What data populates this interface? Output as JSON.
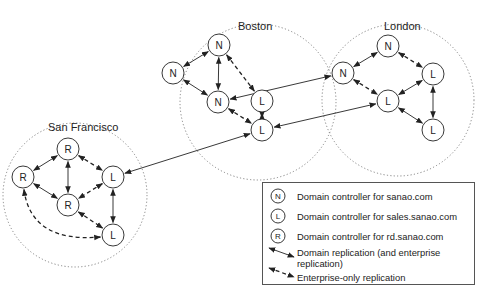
{
  "sites": [
    {
      "name": "Boston",
      "boundary": {
        "cx": 258,
        "cy": 102,
        "r": 78
      },
      "label_pos": {
        "x": 238,
        "y": 30
      },
      "nodes": [
        {
          "id": "b1",
          "letter": "N",
          "x": 219,
          "y": 45
        },
        {
          "id": "b2",
          "letter": "N",
          "x": 173,
          "y": 73
        },
        {
          "id": "b3",
          "letter": "L",
          "x": 262,
          "y": 101
        },
        {
          "id": "b4",
          "letter": "N",
          "x": 218,
          "y": 102
        },
        {
          "id": "b5",
          "letter": "L",
          "x": 262,
          "y": 130
        }
      ]
    },
    {
      "name": "London",
      "boundary": {
        "cx": 398,
        "cy": 100,
        "r": 76
      },
      "label_pos": {
        "x": 384,
        "y": 30
      },
      "nodes": [
        {
          "id": "l1",
          "letter": "N",
          "x": 388,
          "y": 46
        },
        {
          "id": "l2",
          "letter": "N",
          "x": 343,
          "y": 73
        },
        {
          "id": "l3",
          "letter": "L",
          "x": 433,
          "y": 74
        },
        {
          "id": "l4",
          "letter": "L",
          "x": 388,
          "y": 101
        },
        {
          "id": "l5",
          "letter": "L",
          "x": 433,
          "y": 130
        }
      ]
    },
    {
      "name": "San Francisco",
      "boundary": {
        "cx": 75,
        "cy": 195,
        "r": 72
      },
      "label_pos": {
        "x": 48,
        "y": 131
      },
      "nodes": [
        {
          "id": "s1",
          "letter": "R",
          "x": 68,
          "y": 149
        },
        {
          "id": "s2",
          "letter": "R",
          "x": 23,
          "y": 177
        },
        {
          "id": "s3",
          "letter": "L",
          "x": 113,
          "y": 177
        },
        {
          "id": "s4",
          "letter": "R",
          "x": 68,
          "y": 205
        },
        {
          "id": "s5",
          "letter": "L",
          "x": 113,
          "y": 235
        }
      ]
    }
  ],
  "edges": [
    {
      "from": "b1",
      "to": "b2",
      "type": "domain"
    },
    {
      "from": "b1",
      "to": "b4",
      "type": "domain"
    },
    {
      "from": "b2",
      "to": "b4",
      "type": "domain"
    },
    {
      "from": "b1",
      "to": "b3",
      "type": "enterprise"
    },
    {
      "from": "b4",
      "to": "b5",
      "type": "enterprise"
    },
    {
      "from": "b3",
      "to": "b5",
      "type": "domain"
    },
    {
      "from": "l1",
      "to": "l2",
      "type": "domain"
    },
    {
      "from": "l1",
      "to": "l3",
      "type": "enterprise"
    },
    {
      "from": "l2",
      "to": "l4",
      "type": "enterprise"
    },
    {
      "from": "l3",
      "to": "l4",
      "type": "domain"
    },
    {
      "from": "l4",
      "to": "l5",
      "type": "domain"
    },
    {
      "from": "l3",
      "to": "l5",
      "type": "domain"
    },
    {
      "from": "s1",
      "to": "s2",
      "type": "domain"
    },
    {
      "from": "s1",
      "to": "s4",
      "type": "domain"
    },
    {
      "from": "s2",
      "to": "s4",
      "type": "domain"
    },
    {
      "from": "s1",
      "to": "s3",
      "type": "enterprise"
    },
    {
      "from": "s3",
      "to": "s4",
      "type": "enterprise"
    },
    {
      "from": "s3",
      "to": "s5",
      "type": "domain"
    },
    {
      "from": "s4",
      "to": "s5",
      "type": "enterprise"
    },
    {
      "from": "s2",
      "to": "s5",
      "type": "enterprise",
      "curved": true
    },
    {
      "from": "b4",
      "to": "l2",
      "type": "domain"
    },
    {
      "from": "b5",
      "to": "l4",
      "type": "domain"
    },
    {
      "from": "s3",
      "to": "b5",
      "type": "domain"
    }
  ],
  "legend": {
    "items": [
      {
        "icon": "N",
        "label": "Domain controller for sanao.com"
      },
      {
        "icon": "L",
        "label": "Domain controller for sales.sanao.com"
      },
      {
        "icon": "R",
        "label": "Domain controller for rd.sanao.com"
      },
      {
        "icon": "solid-arrow",
        "label": "Domain replication (and enterprise replication)",
        "line1": "Domain replication (and enterprise",
        "line2": "replication)"
      },
      {
        "icon": "dashed-arrow",
        "label": "Enterprise-only replication"
      }
    ]
  },
  "style": {
    "stroke": "#222222",
    "boundary_stroke": "#777777",
    "background": "#ffffff"
  }
}
